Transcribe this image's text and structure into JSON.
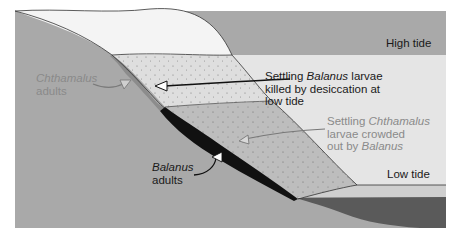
{
  "figure": {
    "type": "intertidal zonation diagram",
    "colors": {
      "background": "#ffffff",
      "rock": "#a9a9a9",
      "sky_band": "#f2f2f2",
      "high_water": "#e5e5e5",
      "upper_zone": "#dedede",
      "lower_zone": "#bdbdbd",
      "chthamalus_band": "#8c8c8c",
      "balanus_band": "#111111",
      "low_water": "#cfcfcf",
      "deep_water": "#5a5a5a",
      "outline": "#333333",
      "dark_text": "#1a1a1a",
      "gray_text": "#8a8a8a"
    }
  },
  "labels": {
    "high_tide": "High tide",
    "low_tide": "Low tide",
    "chthamalus_adults": {
      "line1": "Chthamalus",
      "line2": "adults"
    },
    "balanus_adults": {
      "line1": "Balanus",
      "line2": "adults"
    },
    "balanus_larvae": {
      "line1_pre": "Settling ",
      "line1_species": "Balanus",
      "line1_post": " larvae",
      "line2": "killed by desiccation at",
      "line3": "low tide"
    },
    "chthamalus_larvae": {
      "line1_pre": "Settling ",
      "line1_species": "Chthamalus",
      "line2": "larvae crowded",
      "line3_pre": "out by ",
      "line3_species": "Balanus"
    }
  }
}
